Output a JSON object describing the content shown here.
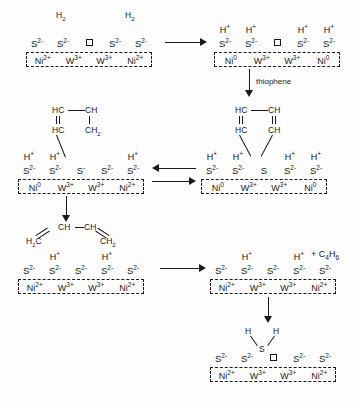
{
  "diagram": {
    "ion_labels": {
      "sulfide": "S",
      "sulfide_charge": "2-",
      "sulfide_mono": "S",
      "sulfide_mono_charge": "-",
      "sulfur_neutral": "S",
      "nickel": "Ni",
      "nickel_2plus": "2+",
      "nickel_0": "0",
      "tungsten": "W",
      "tungsten_3plus": "3+",
      "proton": "H",
      "proton_charge": "+",
      "hydrogen": "H",
      "hydrogen_sub": "2",
      "hydrogen_atom": "H",
      "vacancy": "vacancy-square"
    },
    "steps": {
      "step1": {
        "name": "fresh-catalyst-with-dihydrogen",
        "h2_left": "H",
        "h2_left_sub": "2",
        "h2_right": "H",
        "h2_right_sub": "2",
        "anions": [
          "S2-",
          "S2-",
          "vacancy",
          "S2-",
          "S2-"
        ],
        "metals": [
          "Ni2+",
          "W3+",
          "W3+",
          "Ni2+"
        ]
      },
      "step2": {
        "name": "heterolytic-h2-dissociation-reduced-nickel",
        "protons": [
          "H+",
          "H+",
          "",
          "H+",
          "H+"
        ],
        "anions": [
          "S2-",
          "S2-",
          "vacancy",
          "S2-",
          "S2-"
        ],
        "metals": [
          "Ni0",
          "W3+",
          "W3+",
          "Ni0"
        ]
      },
      "step3": {
        "name": "thiophene-adsorbed-on-vacancy",
        "protons": [
          "H+",
          "H+",
          "",
          "H+",
          "H+"
        ],
        "anions": [
          "S2-",
          "S2-",
          "S",
          "S2-",
          "S2-"
        ],
        "metals": [
          "Ni0",
          "W3+",
          "W3+",
          "Ni0"
        ],
        "ring": {
          "top_left": "HC",
          "top_right": "CH",
          "bottom_left": "HC",
          "bottom_right": "CH"
        }
      },
      "step4": {
        "name": "partially-hydrogenated-thiophene-intermediate",
        "protons": [
          "H+",
          "H+",
          "",
          "",
          "H+"
        ],
        "anions": [
          "S2-",
          "S2-",
          "S-",
          "S2-",
          "S2-"
        ],
        "metals": [
          "Ni0",
          "W3+",
          "W3+",
          "Ni2+"
        ],
        "ring": {
          "top_left": "HC",
          "top_right": "CH",
          "bottom_left": "HC",
          "bottom_right": "CH",
          "bottom_right_sub": "2"
        }
      },
      "step5": {
        "name": "butadiene-bound-surface",
        "protons": [
          "",
          "H+",
          "",
          "H+",
          ""
        ],
        "anions": [
          "S2-",
          "S2-",
          "S2-",
          "S2-",
          "S2-"
        ],
        "metals": [
          "Ni2+",
          "W3+",
          "W3+",
          "Ni2+"
        ],
        "butadiene": {
          "left": "H",
          "left_sub": "2",
          "left_c": "C",
          "mid_left": "CH",
          "mid_right": "CH",
          "right": "CH",
          "right_sub": "2"
        }
      },
      "step6": {
        "name": "butadiene-released-surface",
        "protons": [
          "",
          "H+",
          "",
          "H+",
          ""
        ],
        "anions": [
          "S2-",
          "S2-",
          "S2-",
          "S2-",
          "S2-"
        ],
        "metals": [
          "Ni2+",
          "W3+",
          "W3+",
          "Ni2+"
        ],
        "product": "+ C4H6",
        "product_c": "C",
        "product_c_sub": "4",
        "product_h": "H",
        "product_h_sub": "6"
      },
      "step7": {
        "name": "hydrogen-sulfide-desorption-vacancy-restored",
        "anions": [
          "S2-",
          "S2-",
          "vacancy",
          "S2-",
          "S2-"
        ],
        "metals": [
          "Ni2+",
          "W3+",
          "W3+",
          "Ni2+"
        ],
        "h2s": {
          "left_h": "H",
          "right_h": "H",
          "sulfur": "S"
        }
      }
    },
    "arrows": {
      "a1": {
        "name": "arrow-step1-to-step2",
        "direction": "right",
        "label": ""
      },
      "a2": {
        "name": "arrow-step2-to-step3",
        "direction": "down",
        "label": "thiophene"
      },
      "a3": {
        "name": "arrow-step3-to-step4-equilibrium",
        "direction": "left-right-pair",
        "label": ""
      },
      "a4": {
        "name": "arrow-step4-to-step5",
        "direction": "down",
        "label": ""
      },
      "a5": {
        "name": "arrow-step5-to-step6",
        "direction": "right",
        "label": ""
      },
      "a6": {
        "name": "arrow-step6-to-step7",
        "direction": "down",
        "label": ""
      }
    }
  }
}
